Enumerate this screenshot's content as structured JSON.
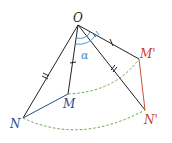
{
  "figure": {
    "points": {
      "O": {
        "label": "O",
        "x": 78,
        "y": 25,
        "color": "#222222"
      },
      "M": {
        "label": "M",
        "x": 68,
        "y": 94,
        "color": "#2a4a8a"
      },
      "N": {
        "label": "N",
        "x": 23,
        "y": 118,
        "color": "#2a4a8a"
      },
      "Mp": {
        "label": "M'",
        "x": 139,
        "y": 59,
        "color": "#c8402a"
      },
      "Np": {
        "label": "N'",
        "x": 145,
        "y": 110,
        "color": "#c8402a"
      }
    },
    "angle_label": "α",
    "colors": {
      "segment": "#222222",
      "image_segment": "#d0503a",
      "arc": "#5a9a3a",
      "angle": "#3a8ac8"
    }
  }
}
